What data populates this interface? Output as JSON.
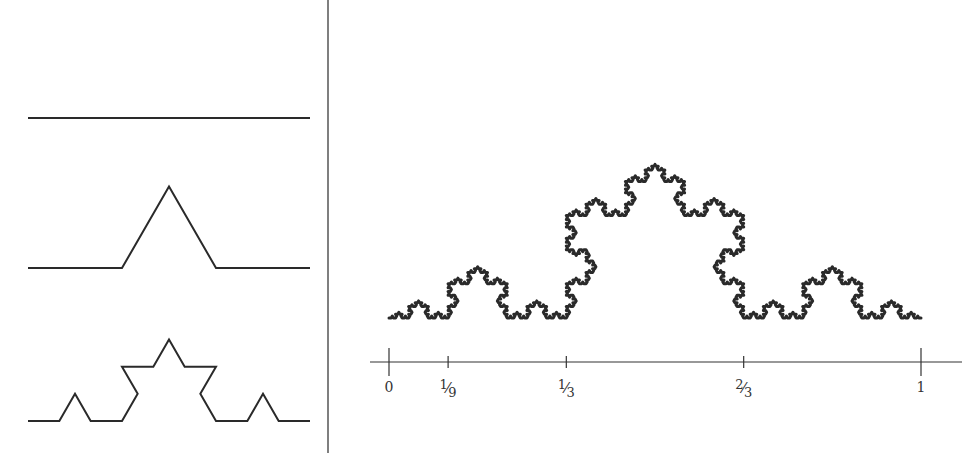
{
  "diagram": {
    "colors": {
      "ink": "#2a2a2a",
      "background": "#ffffff",
      "divider": "#555555"
    },
    "divider": {
      "x": 328,
      "y1": 0,
      "y2": 453
    },
    "left_panel": {
      "description": "First three stages of Koch curve construction",
      "stages": [
        {
          "iteration": 0,
          "x0": 28,
          "x1": 310,
          "baseline_y": 118
        },
        {
          "iteration": 1,
          "x0": 28,
          "x1": 310,
          "baseline_y": 268
        },
        {
          "iteration": 2,
          "x0": 28,
          "x1": 310,
          "baseline_y": 421
        }
      ]
    },
    "right_panel": {
      "description": "Koch curve (limit) above unit interval",
      "curve": {
        "x0": 389,
        "x1": 921,
        "baseline_y": 318,
        "iterations": 5
      },
      "axis": {
        "y": 362,
        "x_start": 370,
        "x_end": 962,
        "unit_x0": 389,
        "unit_x1": 921,
        "ticks": [
          {
            "value": 0,
            "num": "0",
            "den": "",
            "major": true
          },
          {
            "value": 0.1111,
            "num": "1",
            "den": "9",
            "major": false
          },
          {
            "value": 0.3333,
            "num": "1",
            "den": "3",
            "major": false
          },
          {
            "value": 0.6667,
            "num": "2",
            "den": "3",
            "major": false
          },
          {
            "value": 1,
            "num": "1",
            "den": "",
            "major": true
          }
        ]
      }
    }
  }
}
